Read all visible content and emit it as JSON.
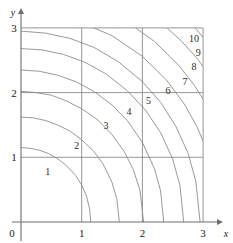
{
  "chart_data": {
    "type": "line",
    "title": "",
    "subtitle": "",
    "xlabel": "x",
    "ylabel": "y",
    "xlim": [
      0,
      3
    ],
    "ylim": [
      0,
      3
    ],
    "xticks": [
      "0",
      "1",
      "2",
      "3"
    ],
    "yticks": [
      "0",
      "1",
      "2",
      "3"
    ],
    "xtick_values": [
      0,
      1,
      2,
      3
    ],
    "ytick_values": [
      0,
      1,
      2,
      3
    ],
    "grid": true,
    "grid_color": "#8a8a8a",
    "axis_color": "#6e6e6e",
    "curve_color": "#8d8d8d",
    "legend": "none",
    "series": [
      {
        "name": "1",
        "label": "1",
        "level": 1,
        "radius": 1.15,
        "label_x": 0.44,
        "label_y": 0.72,
        "points": [
          [
            0.0,
            1.15
          ],
          [
            0.15,
            1.14
          ],
          [
            0.3,
            1.11
          ],
          [
            0.45,
            1.06
          ],
          [
            0.6,
            0.98
          ],
          [
            0.75,
            0.87
          ],
          [
            0.9,
            0.72
          ],
          [
            1.0,
            0.57
          ],
          [
            1.08,
            0.4
          ],
          [
            1.13,
            0.2
          ],
          [
            1.15,
            0.0
          ]
        ]
      },
      {
        "name": "2",
        "label": "2",
        "level": 2,
        "radius": 1.62,
        "label_x": 0.92,
        "label_y": 1.13,
        "points": [
          [
            0.0,
            1.62
          ],
          [
            0.2,
            1.61
          ],
          [
            0.4,
            1.57
          ],
          [
            0.6,
            1.5
          ],
          [
            0.8,
            1.41
          ],
          [
            1.0,
            1.27
          ],
          [
            1.2,
            1.09
          ],
          [
            1.35,
            0.9
          ],
          [
            1.5,
            0.61
          ],
          [
            1.58,
            0.35
          ],
          [
            1.62,
            0.0
          ]
        ]
      },
      {
        "name": "3",
        "label": "3",
        "level": 3,
        "radius": 2.02,
        "label_x": 1.4,
        "label_y": 1.43,
        "points": [
          [
            0.0,
            2.02
          ],
          [
            0.25,
            2.0
          ],
          [
            0.5,
            1.96
          ],
          [
            0.75,
            1.87
          ],
          [
            1.0,
            1.75
          ],
          [
            1.25,
            1.59
          ],
          [
            1.5,
            1.35
          ],
          [
            1.7,
            1.09
          ],
          [
            1.85,
            0.81
          ],
          [
            1.96,
            0.49
          ],
          [
            2.02,
            0.0
          ]
        ]
      },
      {
        "name": "4",
        "label": "4",
        "level": 4,
        "radius": 2.35,
        "label_x": 1.78,
        "label_y": 1.65,
        "points": [
          [
            0.0,
            2.35
          ],
          [
            0.3,
            2.33
          ],
          [
            0.6,
            2.27
          ],
          [
            0.9,
            2.17
          ],
          [
            1.2,
            2.02
          ],
          [
            1.5,
            1.81
          ],
          [
            1.75,
            1.57
          ],
          [
            2.0,
            1.23
          ],
          [
            2.2,
            0.82
          ],
          [
            2.3,
            0.48
          ],
          [
            2.35,
            0.0
          ]
        ]
      },
      {
        "name": "5",
        "label": "5",
        "level": 5,
        "radius": 2.68,
        "label_x": 2.1,
        "label_y": 1.83,
        "points": [
          [
            0.0,
            2.68
          ],
          [
            0.35,
            2.66
          ],
          [
            0.7,
            2.59
          ],
          [
            1.05,
            2.47
          ],
          [
            1.4,
            2.29
          ],
          [
            1.75,
            2.03
          ],
          [
            2.05,
            1.73
          ],
          [
            2.3,
            1.38
          ],
          [
            2.5,
            0.97
          ],
          [
            2.62,
            0.56
          ],
          [
            2.68,
            0.0
          ]
        ]
      },
      {
        "name": "6",
        "label": "6",
        "level": 6,
        "radius": 2.95,
        "label_x": 2.42,
        "label_y": 1.98,
        "points": [
          [
            0.0,
            2.95
          ],
          [
            0.4,
            2.92
          ],
          [
            0.8,
            2.84
          ],
          [
            1.2,
            2.7
          ],
          [
            1.6,
            2.48
          ],
          [
            2.0,
            2.17
          ],
          [
            2.3,
            1.85
          ],
          [
            2.55,
            1.48
          ],
          [
            2.75,
            1.07
          ],
          [
            2.88,
            0.63
          ],
          [
            2.95,
            0.0
          ]
        ]
      },
      {
        "name": "7",
        "label": "7",
        "level": 7,
        "radius": 3.25,
        "label_x": 2.7,
        "label_y": 2.12,
        "points": [
          [
            0.0,
            3.25
          ],
          [
            0.5,
            3.21
          ],
          [
            1.0,
            3.08
          ],
          [
            1.5,
            2.88
          ],
          [
            2.0,
            2.56
          ],
          [
            2.4,
            2.19
          ],
          [
            2.7,
            1.81
          ],
          [
            2.9,
            1.47
          ],
          [
            3.0,
            1.25
          ]
        ]
      },
      {
        "name": "8",
        "label": "8",
        "level": 8,
        "radius": 3.55,
        "label_x": 2.85,
        "label_y": 2.35,
        "points": [
          [
            0.25,
            3.0
          ],
          [
            0.8,
            3.43
          ],
          [
            1.3,
            3.3
          ],
          [
            1.8,
            3.06
          ],
          [
            2.2,
            2.79
          ],
          [
            2.6,
            2.42
          ],
          [
            2.85,
            2.12
          ],
          [
            3.0,
            1.9
          ]
        ]
      },
      {
        "name": "9",
        "label": "9",
        "level": 9,
        "radius": 3.85,
        "label_x": 2.92,
        "label_y": 2.57,
        "points": [
          [
            0.95,
            3.0
          ],
          [
            1.4,
            3.59
          ],
          [
            1.9,
            3.35
          ],
          [
            2.3,
            3.09
          ],
          [
            2.65,
            2.79
          ],
          [
            2.9,
            2.53
          ],
          [
            3.0,
            2.4
          ]
        ]
      },
      {
        "name": "10",
        "label": "10",
        "level": 10,
        "radius": 4.15,
        "label_x": 2.85,
        "label_y": 2.78,
        "points": [
          [
            1.6,
            3.0
          ],
          [
            2.0,
            3.63
          ],
          [
            2.4,
            3.39
          ],
          [
            2.7,
            3.16
          ],
          [
            2.9,
            2.97
          ],
          [
            3.0,
            2.85
          ]
        ]
      }
    ]
  }
}
